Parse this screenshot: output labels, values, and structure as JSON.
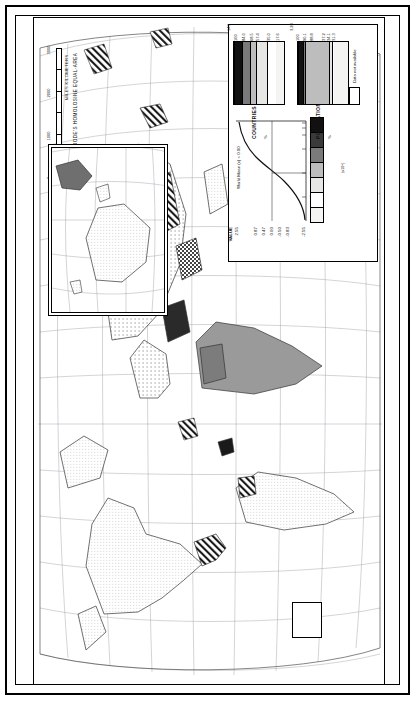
{
  "page": {
    "title": "FACTOR 2. MAGNITUDE"
  },
  "projection": {
    "name": "MODIFIED GOODE'S HOMOLOSINE EQUAL-AREA PROJECTION",
    "scale_unit": "MILES KILOMETERS",
    "scale_ticks": [
      "0",
      "1000",
      "2000",
      "3000"
    ],
    "scale_zero": "0"
  },
  "legend": {
    "value_header": "VALUE",
    "value_breaks": [
      "2.55",
      "0.87",
      "0.47",
      "0.00",
      "-0.50",
      "-0.83",
      "-2.55"
    ],
    "world_mean": "World Mean (x) = 0.00",
    "percentile_ticks": [
      "25",
      "50",
      "75",
      "90",
      "95",
      "99"
    ],
    "swatch_colors": [
      "#f2f2f0",
      "#ffffff",
      "#e4e4e2",
      "#bdbdbd",
      "#7a7a7a",
      "#3a3a3a",
      "#111111"
    ],
    "countries": {
      "label": "COUNTRIES",
      "unit": "%",
      "cum_values": [
        "17.6",
        "35.0",
        "57.4",
        "68.5",
        "84.0",
        "100"
      ],
      "count": "143"
    },
    "population": {
      "label": "POPULATION",
      "unit": "%",
      "unit_note": "(x10⁹)",
      "cum_values": [
        "31.3",
        "34.1",
        "37.2",
        "88.8",
        "90.1",
        "100"
      ],
      "counts": [
        "1.82",
        "88.8",
        "90.1",
        "100",
        "1.66"
      ],
      "total": "3.28"
    },
    "no_data": {
      "label": "Data not available"
    }
  },
  "inset": {
    "lon_labels": [
      "120°",
      "140°",
      "160°",
      "180°"
    ],
    "lat_labels": [
      "20°",
      "0°",
      "20°",
      "40°"
    ]
  }
}
